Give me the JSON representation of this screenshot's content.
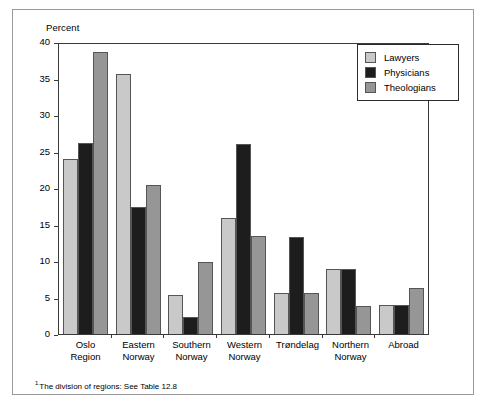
{
  "figure": {
    "axis_title": "Percent",
    "footnote_marker": "1",
    "footnote": "The division of regions: See Table 12.8"
  },
  "legend": {
    "position": "top-right",
    "items": [
      {
        "label": "Lawyers",
        "color": "#c9c9c9"
      },
      {
        "label": "Physicians",
        "color": "#1d1d1d"
      },
      {
        "label": "Theologians",
        "color": "#969696"
      }
    ]
  },
  "axes": {
    "y_ticks": [
      40,
      35,
      30,
      25,
      20,
      15,
      10,
      5,
      0
    ],
    "y_min": 0,
    "y_max": 40
  },
  "chart_data": {
    "type": "bar",
    "title": "",
    "subtitle": "",
    "xlabel": "",
    "ylabel": "Percent",
    "ylim": [
      0,
      40
    ],
    "ytick_step": 5,
    "grid": false,
    "legend_position": "top-right",
    "categories": [
      "Oslo\nRegion",
      "Eastern\nNorway",
      "Southern\nNorway",
      "Western\nNorway",
      "Trøndelag",
      "Northern\nNorway",
      "Abroad"
    ],
    "series": [
      {
        "name": "Lawyers",
        "color": "#c9c9c9",
        "values": [
          24.1,
          35.8,
          5.4,
          16.0,
          5.6,
          8.9,
          4.0
        ]
      },
      {
        "name": "Physicians",
        "color": "#1d1d1d",
        "values": [
          26.3,
          17.5,
          2.4,
          26.2,
          13.4,
          8.9,
          4.0
        ]
      },
      {
        "name": "Theologians",
        "color": "#969696",
        "values": [
          38.9,
          20.5,
          9.9,
          13.5,
          5.6,
          3.9,
          6.3
        ]
      }
    ]
  }
}
